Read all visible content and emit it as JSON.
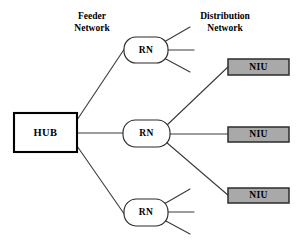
{
  "diagram": {
    "background_color": "#ffffff",
    "width": 299,
    "height": 242,
    "labels": {
      "feeder": {
        "line1": "Feeder",
        "line2": "Network"
      },
      "distribution": {
        "line1": "Distribution",
        "line2": "Network"
      }
    },
    "colors": {
      "line": "#3a3a3a",
      "hub_fill": "#ffffff",
      "hub_stroke": "#000000",
      "rn_fill": "#ffffff",
      "rn_stroke": "#2a2a2a",
      "niu_fill": "#a9a9a9",
      "niu_stroke": "#2c2c2c",
      "text": "#000000"
    },
    "nodes": {
      "hub": {
        "label": "HUB",
        "x": 14,
        "y": 113,
        "width": 63,
        "height": 39
      },
      "remote_nodes": [
        {
          "label": "RN",
          "position": "top",
          "x": 124,
          "y": 37,
          "width": 44,
          "height": 26
        },
        {
          "label": "RN",
          "position": "middle",
          "x": 123,
          "y": 120,
          "width": 47,
          "height": 27
        },
        {
          "label": "RN",
          "position": "bottom",
          "x": 124,
          "y": 199,
          "width": 44,
          "height": 27
        }
      ],
      "network_interface_units": [
        {
          "label": "NIU",
          "position": "top",
          "x": 228,
          "y": 59,
          "width": 61,
          "height": 16
        },
        {
          "label": "NIU",
          "position": "middle",
          "x": 228,
          "y": 127,
          "width": 61,
          "height": 15
        },
        {
          "label": "NIU",
          "position": "bottom",
          "x": 228,
          "y": 188,
          "width": 61,
          "height": 15
        }
      ]
    },
    "connections": {
      "feeder_links": [
        {
          "from": "hub",
          "to": "rn-top"
        },
        {
          "from": "hub",
          "to": "rn-middle"
        },
        {
          "from": "hub",
          "to": "rn-bottom"
        }
      ],
      "distribution_links": [
        {
          "from": "rn-middle",
          "to": "niu-top"
        },
        {
          "from": "rn-middle",
          "to": "niu-middle"
        },
        {
          "from": "rn-middle",
          "to": "niu-bottom"
        }
      ],
      "stub_links": [
        {
          "from": "rn-top",
          "count": 3
        },
        {
          "from": "rn-bottom",
          "count": 3
        }
      ]
    }
  }
}
